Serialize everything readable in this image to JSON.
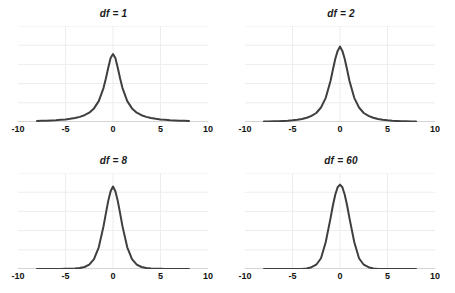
{
  "figure": {
    "panel_count": 4,
    "curve_color": "#3f3f3f",
    "gridline_color": "#ededed",
    "axis_color": "#333333",
    "background_color": "#ffffff"
  },
  "chart_data": [
    {
      "type": "line",
      "title": "df = 1",
      "xlabel": "",
      "ylabel": "",
      "xlim": [
        -10,
        10
      ],
      "ylim": [
        0,
        0.45
      ],
      "xticks": [
        -10,
        -5,
        0,
        5,
        10
      ],
      "xticklabels": [
        "-10",
        "-5",
        "0",
        "5",
        "10"
      ],
      "grid": true,
      "gridlines_horizontal": 5,
      "legend": "none",
      "series": [
        {
          "name": "t density df=1",
          "x": [
            -8,
            -7.5,
            -7,
            -6.5,
            -6,
            -5.5,
            -5,
            -4.5,
            -4,
            -3.5,
            -3,
            -2.5,
            -2,
            -1.5,
            -1,
            -0.75,
            -0.5,
            -0.25,
            0,
            0.25,
            0.5,
            0.75,
            1,
            1.5,
            2,
            2.5,
            3,
            3.5,
            4,
            4.5,
            5,
            5.5,
            6,
            6.5,
            7,
            7.5,
            8
          ],
          "y": [
            0.0049,
            0.0056,
            0.0064,
            0.0074,
            0.0086,
            0.0103,
            0.0122,
            0.015,
            0.0187,
            0.0241,
            0.0318,
            0.0439,
            0.0637,
            0.0979,
            0.1592,
            0.2037,
            0.2546,
            0.2996,
            0.3183,
            0.2996,
            0.2546,
            0.2037,
            0.1592,
            0.0979,
            0.0637,
            0.0439,
            0.0318,
            0.0241,
            0.0187,
            0.015,
            0.0122,
            0.0103,
            0.0086,
            0.0074,
            0.0064,
            0.0056,
            0.0049
          ]
        }
      ]
    },
    {
      "type": "line",
      "title": "df = 2",
      "xlabel": "",
      "ylabel": "",
      "xlim": [
        -10,
        10
      ],
      "ylim": [
        0,
        0.45
      ],
      "xticks": [
        -10,
        -5,
        0,
        5,
        10
      ],
      "xticklabels": [
        "-10",
        "-5",
        "0",
        "5",
        "10"
      ],
      "grid": true,
      "gridlines_horizontal": 5,
      "legend": "none",
      "series": [
        {
          "name": "t density df=2",
          "x": [
            -8,
            -7.5,
            -7,
            -6.5,
            -6,
            -5.5,
            -5,
            -4.5,
            -4,
            -3.5,
            -3,
            -2.5,
            -2,
            -1.5,
            -1,
            -0.75,
            -0.5,
            -0.25,
            0,
            0.25,
            0.5,
            0.75,
            1,
            1.5,
            2,
            2.5,
            3,
            3.5,
            4,
            4.5,
            5,
            5.5,
            6,
            6.5,
            7,
            7.5,
            8
          ],
          "y": [
            0.0021,
            0.0025,
            0.0031,
            0.0038,
            0.0048,
            0.0061,
            0.0079,
            0.0105,
            0.0143,
            0.02,
            0.0289,
            0.0422,
            0.068,
            0.1132,
            0.1924,
            0.2448,
            0.2952,
            0.3333,
            0.3536,
            0.3333,
            0.2952,
            0.2448,
            0.1924,
            0.1132,
            0.068,
            0.0422,
            0.0289,
            0.02,
            0.0143,
            0.0105,
            0.0079,
            0.0061,
            0.0048,
            0.0038,
            0.0031,
            0.0025,
            0.0021
          ]
        }
      ]
    },
    {
      "type": "line",
      "title": "df = 8",
      "xlabel": "",
      "ylabel": "",
      "xlim": [
        -10,
        10
      ],
      "ylim": [
        0,
        0.45
      ],
      "xticks": [
        -10,
        -5,
        0,
        5,
        10
      ],
      "xticklabels": [
        "-10",
        "-5",
        "0",
        "5",
        "10"
      ],
      "grid": true,
      "gridlines_horizontal": 5,
      "legend": "none",
      "series": [
        {
          "name": "t density df=8",
          "x": [
            -8,
            -7.5,
            -7,
            -6.5,
            -6,
            -5.5,
            -5,
            -4.5,
            -4,
            -3.5,
            -3,
            -2.5,
            -2,
            -1.5,
            -1,
            -0.75,
            -0.5,
            -0.25,
            0,
            0.25,
            0.5,
            0.75,
            1,
            1.5,
            2,
            2.5,
            3,
            3.5,
            4,
            4.5,
            5,
            5.5,
            6,
            6.5,
            7,
            7.5,
            8
          ],
          "y": [
            3e-05,
            5e-05,
            8e-05,
            0.00013,
            0.00022,
            0.00037,
            0.00064,
            0.00117,
            0.00222,
            0.00444,
            0.00933,
            0.02059,
            0.04657,
            0.1017,
            0.19974,
            0.26097,
            0.31933,
            0.36477,
            0.38707,
            0.36477,
            0.31933,
            0.26097,
            0.19974,
            0.1017,
            0.04657,
            0.02059,
            0.00933,
            0.00444,
            0.00222,
            0.00117,
            0.00064,
            0.00037,
            0.00022,
            0.00013,
            8e-05,
            5e-05,
            3e-05
          ]
        }
      ]
    },
    {
      "type": "line",
      "title": "df = 60",
      "xlabel": "",
      "ylabel": "",
      "xlim": [
        -10,
        10
      ],
      "ylim": [
        0,
        0.45
      ],
      "xticks": [
        -10,
        -5,
        0,
        5,
        10
      ],
      "xticklabels": [
        "-10",
        "-5",
        "0",
        "5",
        "10"
      ],
      "grid": true,
      "gridlines_horizontal": 5,
      "legend": "none",
      "series": [
        {
          "name": "t density df=60",
          "x": [
            -8,
            -7.5,
            -7,
            -6.5,
            -6,
            -5.5,
            -5,
            -4.5,
            -4,
            -3.5,
            -3,
            -2.5,
            -2,
            -1.5,
            -1,
            -0.75,
            -0.5,
            -0.25,
            0,
            0.25,
            0.5,
            0.75,
            1,
            1.5,
            2,
            2.5,
            3,
            3.5,
            4,
            4.5,
            5,
            5.5,
            6,
            6.5,
            7,
            7.5,
            8
          ],
          "y": [
            2e-07,
            5e-07,
            1.2e-06,
            2.9e-06,
            7.3e-06,
            1.95e-05,
            5.56e-05,
            0.00017,
            0.000565,
            0.00206,
            0.00832,
            0.02001,
            0.05026,
            0.12687,
            0.23722,
            0.29745,
            0.34834,
            0.38316,
            0.39543,
            0.38316,
            0.34834,
            0.29745,
            0.23722,
            0.12687,
            0.05026,
            0.02001,
            0.00832,
            0.00206,
            0.000565,
            0.00017,
            5.56e-05,
            1.95e-05,
            7.3e-06,
            2.9e-06,
            1.2e-06,
            5e-07,
            2e-07
          ]
        }
      ]
    }
  ]
}
